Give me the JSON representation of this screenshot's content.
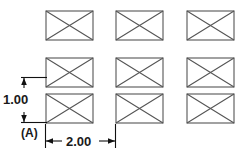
{
  "drawing": {
    "title": "Rectangular pattern dimension drawing",
    "datum_label": "(A)",
    "line_color": "#555555",
    "dim_color": "#111111",
    "background": "#ffffff",
    "dimensions": [
      {
        "name": "vertical-pitch",
        "value": "1.00",
        "orientation": "vertical",
        "text_x": 3,
        "text_y": 104
      },
      {
        "name": "horizontal-pitch",
        "value": "2.00",
        "orientation": "horizontal",
        "text_x": 66,
        "text_y": 146
      }
    ],
    "grid": {
      "rows": 3,
      "columns": 3,
      "cell_width": 47,
      "cell_height": 29,
      "column_x": [
        46,
        116,
        187
      ],
      "row_y": [
        11,
        58,
        94
      ],
      "cells": [
        {
          "name": "rect-r1-c1",
          "x": 46,
          "y": 11
        },
        {
          "name": "rect-r1-c2",
          "x": 116,
          "y": 11
        },
        {
          "name": "rect-r1-c3",
          "x": 187,
          "y": 11
        },
        {
          "name": "rect-r2-c1",
          "x": 46,
          "y": 58
        },
        {
          "name": "rect-r2-c2",
          "x": 116,
          "y": 58
        },
        {
          "name": "rect-r2-c3",
          "x": 187,
          "y": 58
        },
        {
          "name": "rect-r3-c1",
          "x": 46,
          "y": 94
        },
        {
          "name": "rect-r3-c2",
          "x": 116,
          "y": 94
        },
        {
          "name": "rect-r3-c3",
          "x": 187,
          "y": 94
        }
      ]
    }
  }
}
